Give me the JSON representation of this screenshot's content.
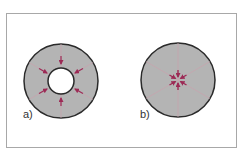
{
  "figure": {
    "panels": [
      {
        "id": "a",
        "label": "a)",
        "description": "Annular cross-section (ring) divided into 6 sectors with arrows pointing radially inward toward a hollow center",
        "shape": "annulus",
        "sectors": 6,
        "arrows": "inward-to-inner-hole"
      },
      {
        "id": "b",
        "label": "b)",
        "description": "Solid circular cross-section divided into 6 sectors with arrows converging at the center point",
        "shape": "disc",
        "sectors": 6,
        "arrows": "inward-to-center"
      }
    ],
    "colors": {
      "fill": "#b4b4b4",
      "outline": "#2a2a2a",
      "arrow": "#9c2a55",
      "sector_lines": "#c9a2ad",
      "frame": "#a8a8a8",
      "background": "#ffffff"
    }
  }
}
